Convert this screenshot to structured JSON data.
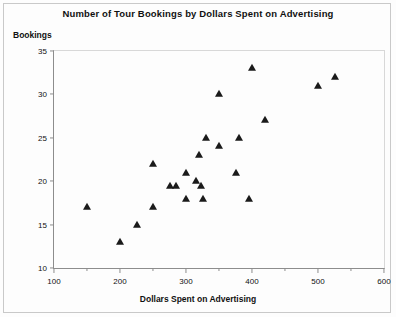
{
  "chart_data": {
    "type": "scatter",
    "title": "Number of Tour Bookings by Dollars Spent on Advertising",
    "xlabel": "Dollars Spent on Advertising",
    "ylabel": "Bookings",
    "xlim": [
      100,
      600
    ],
    "ylim": [
      10,
      35
    ],
    "xticks": [
      100,
      200,
      300,
      400,
      500,
      600
    ],
    "xtick_labels": [
      "100",
      "200",
      "300",
      "400",
      "500",
      "600"
    ],
    "x_minor_ticks": [
      150,
      250,
      350,
      450,
      550
    ],
    "yticks": [
      10,
      15,
      20,
      25,
      30,
      35
    ],
    "ytick_labels": [
      "10",
      "15",
      "20",
      "25",
      "30",
      "35"
    ],
    "grid": false,
    "legend": false,
    "marker": "triangle",
    "marker_color": "#1a1a1a",
    "points": [
      {
        "x": 150,
        "y": 17
      },
      {
        "x": 200,
        "y": 13
      },
      {
        "x": 225,
        "y": 15
      },
      {
        "x": 250,
        "y": 22
      },
      {
        "x": 250,
        "y": 17
      },
      {
        "x": 275,
        "y": 19.5
      },
      {
        "x": 285,
        "y": 19.5
      },
      {
        "x": 300,
        "y": 21
      },
      {
        "x": 300,
        "y": 18
      },
      {
        "x": 315,
        "y": 20
      },
      {
        "x": 320,
        "y": 23
      },
      {
        "x": 322,
        "y": 19.5
      },
      {
        "x": 325,
        "y": 18
      },
      {
        "x": 330,
        "y": 25
      },
      {
        "x": 350,
        "y": 24
      },
      {
        "x": 350,
        "y": 30
      },
      {
        "x": 375,
        "y": 21
      },
      {
        "x": 380,
        "y": 25
      },
      {
        "x": 395,
        "y": 18
      },
      {
        "x": 400,
        "y": 33
      },
      {
        "x": 420,
        "y": 27
      },
      {
        "x": 500,
        "y": 31
      },
      {
        "x": 525,
        "y": 32
      }
    ]
  }
}
